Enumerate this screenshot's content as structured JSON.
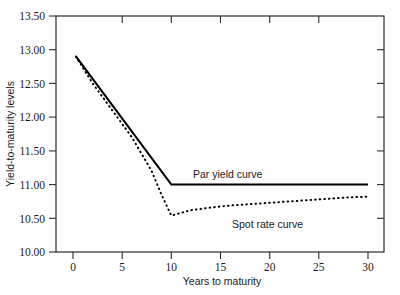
{
  "chart_data": {
    "type": "line",
    "title": "",
    "xlabel": "Years to maturity",
    "ylabel": "Yield-to-maturity levels",
    "xlim": [
      0,
      30
    ],
    "ylim": [
      10.0,
      13.5
    ],
    "xticks": [
      0,
      5,
      10,
      15,
      20,
      25,
      30
    ],
    "xtick_labels": [
      "0",
      "5",
      "10",
      "15",
      "20",
      "25",
      "30"
    ],
    "yticks": [
      10.0,
      10.5,
      11.0,
      11.5,
      12.0,
      12.5,
      13.0,
      13.5
    ],
    "ytick_labels": [
      "10.00",
      "10.50",
      "11.00",
      "11.50",
      "12.00",
      "12.50",
      "13.00",
      "13.50"
    ],
    "grid": false,
    "legend_position": "inline-annotation",
    "frame": "box-all-sides",
    "series": [
      {
        "name": "Par yield curve",
        "style": "solid",
        "color": "#000000",
        "annotation": "Par yield curve",
        "x": [
          0.3,
          10,
          30
        ],
        "values": [
          12.9,
          11.0,
          11.0
        ]
      },
      {
        "name": "Spot rate curve",
        "style": "dotted",
        "color": "#000000",
        "annotation": "Spot rate curve",
        "x": [
          0.3,
          2,
          4,
          6,
          8,
          9,
          10,
          11,
          12,
          14,
          16,
          18,
          20,
          22,
          24,
          26,
          28,
          30
        ],
        "values": [
          12.9,
          12.5,
          12.1,
          11.7,
          11.2,
          10.85,
          10.54,
          10.58,
          10.62,
          10.66,
          10.69,
          10.71,
          10.73,
          10.75,
          10.77,
          10.79,
          10.81,
          10.82
        ]
      }
    ],
    "annotations": [
      {
        "text": "Par yield curve",
        "x": 12.0,
        "y": 11.17
      },
      {
        "text": "Spot rate curve",
        "x": 16.2,
        "y": 10.46
      }
    ]
  }
}
